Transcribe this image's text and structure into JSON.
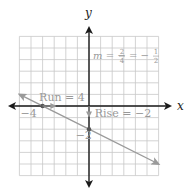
{
  "chart_data": {
    "type": "line",
    "title": "",
    "xlabel": "x",
    "ylabel": "y",
    "xlim": [
      -6,
      6
    ],
    "ylim": [
      -6,
      6
    ],
    "grid": true,
    "series": [
      {
        "name": "line",
        "slope": -0.5,
        "intercept": -2,
        "x_range": [
          -6,
          6
        ],
        "color": "#9a9a9a"
      }
    ],
    "points": [
      {
        "name": "x-intercept",
        "x": -4,
        "y": 0
      },
      {
        "name": "y-intercept",
        "x": 0,
        "y": -2
      }
    ],
    "tick_labels": [
      {
        "axis": "x",
        "value": -4,
        "text": "−4"
      },
      {
        "axis": "y",
        "value": -2,
        "text": "−2"
      }
    ],
    "annotations": {
      "slope": {
        "prefix": "m = −",
        "num1": "2",
        "den1": "4",
        "eq": "= −",
        "num2": "1",
        "den2": "2"
      },
      "run": "Run = 4",
      "rise": "Rise = −2"
    }
  },
  "colors": {
    "axis": "#1a1a1a",
    "grid": "#c8c8c8",
    "line": "#9a9a9a",
    "annotation": "#999999"
  }
}
